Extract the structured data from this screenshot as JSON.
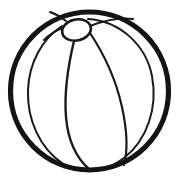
{
  "artwork": {
    "title": "Beach ball line drawing",
    "subject": "beach-ball",
    "style": "coloring-book line art",
    "background_color": "#ffffff",
    "line_color": "#1a1a1a",
    "canvas": {
      "width": 179,
      "height": 182
    },
    "shapes": {
      "outer_circle": {
        "name": "ball outline",
        "cx": 89.5,
        "cy": 91,
        "r": 79.5,
        "stroke_width": 5.2,
        "color": "#141414"
      },
      "cap_ellipse": {
        "name": "ball cap",
        "cx": 76.5,
        "cy": 30,
        "rx": 14.5,
        "ry": 10.5,
        "rotation": -12,
        "stroke_width": 2.6,
        "color": "#1a1a1a"
      },
      "left_inner_arc": {
        "name": "left segment seam",
        "stroke_width": 2.0,
        "color": "#1a1a1a"
      },
      "right_inner_arc": {
        "name": "right segment seam",
        "stroke_width": 2.0,
        "color": "#1a1a1a"
      },
      "center_left_seam": {
        "name": "center-left segment seam",
        "stroke_width": 2.4,
        "color": "#1a1a1a"
      },
      "center_right_seam": {
        "name": "center-right segment seam",
        "stroke_width": 2.2,
        "color": "#1a1a1a"
      },
      "cap_spoke_left": {
        "name": "cap spoke to left seam",
        "stroke_width": 2.0,
        "color": "#1a1a1a"
      },
      "cap_spoke_upper_right": {
        "name": "cap spoke to upper right",
        "stroke_width": 2.0,
        "color": "#1a1a1a"
      },
      "cap_spoke_upper_left": {
        "name": "cap spoke to upper left",
        "stroke_width": 2.0,
        "color": "#1a1a1a"
      }
    }
  }
}
